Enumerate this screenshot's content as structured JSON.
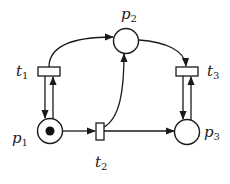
{
  "diagram": {
    "type": "petri-net",
    "places": [
      {
        "id": "p1",
        "label": "p",
        "sub": "1",
        "tokens": 1
      },
      {
        "id": "p2",
        "label": "p",
        "sub": "2",
        "tokens": 0
      },
      {
        "id": "p3",
        "label": "p",
        "sub": "3",
        "tokens": 0
      }
    ],
    "transitions": [
      {
        "id": "t1",
        "label": "t",
        "sub": "1"
      },
      {
        "id": "t2",
        "label": "t",
        "sub": "2"
      },
      {
        "id": "t3",
        "label": "t",
        "sub": "3"
      }
    ],
    "arcs": [
      {
        "from": "t1",
        "to": "p2"
      },
      {
        "from": "p2",
        "to": "t3"
      },
      {
        "from": "t1",
        "to": "p1"
      },
      {
        "from": "p1",
        "to": "t1"
      },
      {
        "from": "t3",
        "to": "p3"
      },
      {
        "from": "p3",
        "to": "t3"
      },
      {
        "from": "p1",
        "to": "t2"
      },
      {
        "from": "t2",
        "to": "p3"
      },
      {
        "from": "t2",
        "to": "p2"
      }
    ]
  }
}
